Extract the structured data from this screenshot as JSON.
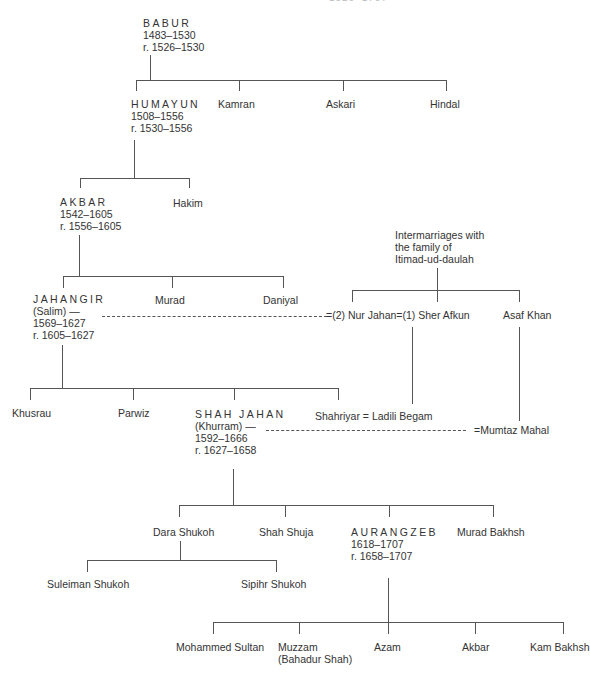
{
  "header_partial": "— — — — — 1526–1707",
  "nodes": {
    "babur": {
      "name": "BABUR",
      "life": "1483–1530",
      "reign": "r. 1526–1530"
    },
    "humayun": {
      "name": "HUMAYUN",
      "life": "1508–1556",
      "reign": "r. 1530–1556"
    },
    "kamran": {
      "name": "Kamran"
    },
    "askari": {
      "name": "Askari"
    },
    "hindal": {
      "name": "Hindal"
    },
    "akbar": {
      "name": "AKBAR",
      "life": "1542–1605",
      "reign": "r. 1556–1605"
    },
    "hakim": {
      "name": "Hakim"
    },
    "jahangir": {
      "name": "JAHANGIR",
      "alias": "(Salim) —",
      "life": "1569–1627",
      "reign": "r. 1605–1627"
    },
    "murad": {
      "name": "Murad"
    },
    "daniyal": {
      "name": "Daniyal"
    },
    "itimad": {
      "line1": "Intermarriages with",
      "line2": "the family of",
      "line3": "Itimad-ud-daulah"
    },
    "nur_sher": {
      "name": "=(2) Nur Jahan=(1) Sher Afkun"
    },
    "asaf_khan": {
      "name": "Asaf Khan"
    },
    "khusrau": {
      "name": "Khusrau"
    },
    "parwiz": {
      "name": "Parwiz"
    },
    "shah_jahan": {
      "name": "SHAH JAHAN",
      "alias": "(Khurram) —",
      "life": "1592–1666",
      "reign": "r. 1627–1658"
    },
    "shahriyar": {
      "name": "Shahriyar = Ladili Begam"
    },
    "mumtaz": {
      "name": "=Mumtaz Mahal"
    },
    "dara": {
      "name": "Dara Shukoh"
    },
    "shah_shuja": {
      "name": "Shah Shuja"
    },
    "aurangzeb": {
      "name": "AURANGZEB",
      "life": "1618–1707",
      "reign": "r. 1658–1707"
    },
    "murad_bakhsh": {
      "name": "Murad Bakhsh"
    },
    "suleiman": {
      "name": "Suleiman Shukoh"
    },
    "sipihr": {
      "name": "Sipihr Shukoh"
    },
    "mohammed_sultan": {
      "name": "Mohammed Sultan"
    },
    "muzzam": {
      "name": "Muzzam",
      "alias": "(Bahadur Shah)"
    },
    "azam": {
      "name": "Azam"
    },
    "akbar2": {
      "name": "Akbar"
    },
    "kam_bakhsh": {
      "name": "Kam Bakhsh"
    }
  },
  "colors": {
    "text": "#333333",
    "lines": "#555555",
    "background": "#ffffff"
  }
}
